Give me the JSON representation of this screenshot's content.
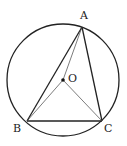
{
  "diagram": {
    "type": "geometry",
    "circle": {
      "cx": 63,
      "cy": 80,
      "r": 56
    },
    "points": {
      "A": {
        "label": "A",
        "x": 82,
        "y": 27
      },
      "B": {
        "label": "B",
        "x": 27,
        "y": 121
      },
      "C": {
        "label": "C",
        "x": 102,
        "y": 121
      },
      "O": {
        "label": "O",
        "x": 63,
        "y": 80
      }
    },
    "colors": {
      "stroke": "#222222",
      "background": "#ffffff"
    }
  }
}
